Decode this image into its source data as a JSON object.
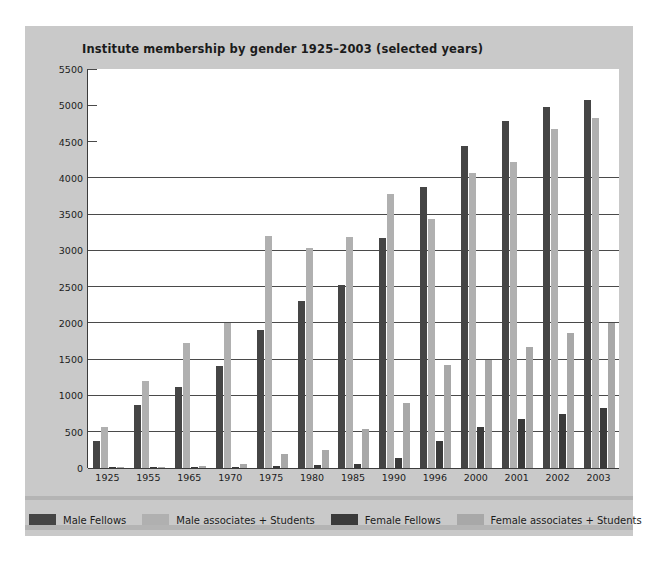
{
  "chart_data": {
    "type": "bar",
    "title": "Institute membership by gender 1925–2003 (selected years)",
    "xlabel": "",
    "ylabel": "",
    "ylim": [
      0,
      5500
    ],
    "ytick_step": 500,
    "yticks": [
      "5500",
      "5000",
      "4500",
      "4000",
      "3500",
      "3000",
      "2500",
      "2000",
      "1500",
      "1000",
      "500",
      "0"
    ],
    "grid": true,
    "legend_position": "bottom",
    "categories": [
      "1925",
      "1955",
      "1965",
      "1970",
      "1975",
      "1980",
      "1985",
      "1990",
      "1996",
      "2000",
      "2001",
      "2002",
      "2003"
    ],
    "series": [
      {
        "name": "Male Fellows",
        "color": "#454545",
        "values": [
          370,
          870,
          1120,
          1400,
          1900,
          2300,
          2520,
          3170,
          3870,
          4440,
          4780,
          4980,
          5070
        ]
      },
      {
        "name": "Male associates + Students",
        "color": "#b0b0b0",
        "values": [
          570,
          1200,
          1720,
          2000,
          3200,
          3030,
          3180,
          3780,
          3430,
          4070,
          4220,
          4680,
          4820
        ]
      },
      {
        "name": "Female Fellows",
        "color": "#3a3a3a",
        "values": [
          10,
          10,
          15,
          20,
          30,
          40,
          50,
          140,
          370,
          560,
          670,
          740,
          830
        ]
      },
      {
        "name": "Female associates + Students",
        "color": "#a8a8a8",
        "values": [
          15,
          20,
          30,
          60,
          200,
          250,
          540,
          890,
          1420,
          1490,
          1670,
          1860,
          2000
        ]
      }
    ]
  },
  "legend": {
    "items": [
      {
        "label": "Male Fellows",
        "color": "#454545"
      },
      {
        "label": "Male associates + Students",
        "color": "#b0b0b0"
      },
      {
        "label": "Female Fellows",
        "color": "#3a3a3a"
      },
      {
        "label": "Female associates + Students",
        "color": "#a8a8a8"
      }
    ]
  }
}
